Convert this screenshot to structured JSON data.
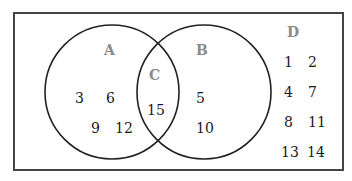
{
  "diagram": {
    "type": "venn",
    "universal_set": {
      "label": "D",
      "elements": [
        "1",
        "2",
        "4",
        "7",
        "8",
        "11",
        "13",
        "14"
      ]
    },
    "sets": [
      {
        "label": "A",
        "elements": [
          "3",
          "6",
          "9",
          "12"
        ]
      },
      {
        "label": "B",
        "elements": [
          "5",
          "10"
        ]
      }
    ],
    "intersection": {
      "label": "C",
      "elements": [
        "15"
      ]
    }
  }
}
